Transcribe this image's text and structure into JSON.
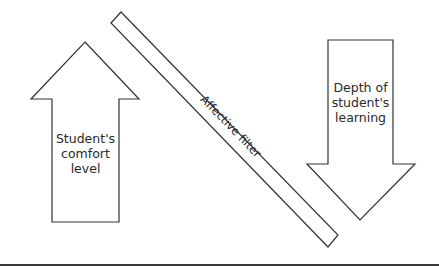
{
  "diagram": {
    "up_arrow": {
      "label_lines": [
        "Student's",
        "comfort",
        "level"
      ]
    },
    "down_arrow": {
      "label_lines": [
        "Depth of",
        "student's",
        "learning"
      ]
    },
    "filter": {
      "label": "Affective filter"
    },
    "colors": {
      "stroke": "#333333",
      "fill": "#ffffff",
      "text": "#2a2a2a"
    }
  }
}
